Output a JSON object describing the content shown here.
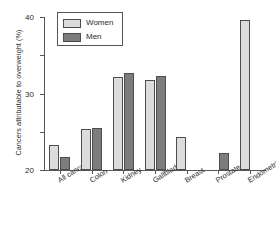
{
  "chart_data": {
    "type": "bar",
    "title": "",
    "xlabel": "",
    "ylabel": "Cancers attributable to overweight (%)",
    "ylim": [
      0,
      40
    ],
    "yticks": [
      0,
      10,
      20,
      30,
      40
    ],
    "grid": false,
    "legend_position": "top-left",
    "categories": [
      "All cancers",
      "Colon",
      "Kidney",
      "Gallbladder",
      "Breast",
      "Prostate",
      "Endometrium"
    ],
    "series": [
      {
        "name": "Women",
        "color": "#dcdcdc",
        "values": [
          6.5,
          10.7,
          24.3,
          23.5,
          8.6,
          null,
          39.2
        ]
      },
      {
        "name": "Men",
        "color": "#7d7d7d",
        "values": [
          3.4,
          11.0,
          25.4,
          24.6,
          null,
          4.4,
          null
        ]
      }
    ]
  },
  "legend": {
    "items": [
      {
        "label": "Women",
        "swatch": "women-swatch"
      },
      {
        "label": "Men",
        "swatch": "men-swatch"
      }
    ]
  },
  "axis": {
    "y_label": "Cancers attributable to overweight (%)",
    "y_tick_labels": [
      "0",
      "10",
      "20",
      "30",
      "40"
    ],
    "x_tick_labels": [
      "All cancers",
      "Colon",
      "Kidney",
      "Gallbladder",
      "Breast",
      "Prostate",
      "Endometrium"
    ]
  }
}
